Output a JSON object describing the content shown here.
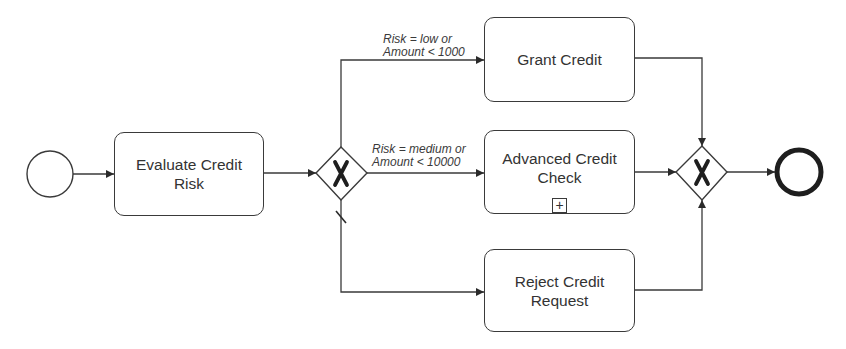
{
  "diagram": {
    "type": "BPMN process",
    "colors": {
      "stroke": "#3a3a3a",
      "text": "#333333",
      "background": "#ffffff"
    },
    "start_event": {
      "kind": "start-event"
    },
    "end_event": {
      "kind": "end-event"
    },
    "tasks": [
      {
        "id": "evaluate",
        "label": "Evaluate Credit Risk"
      },
      {
        "id": "grant",
        "label": "Grant Credit"
      },
      {
        "id": "advanced",
        "label": "Advanced Credit Check",
        "marker": "+"
      },
      {
        "id": "reject",
        "label": "Reject Credit Request"
      }
    ],
    "gateways": [
      {
        "id": "split",
        "kind": "exclusive-gateway",
        "marker": "X"
      },
      {
        "id": "merge",
        "kind": "exclusive-gateway",
        "marker": "X"
      }
    ],
    "flows": [
      {
        "from": "start",
        "to": "evaluate"
      },
      {
        "from": "evaluate",
        "to": "split"
      },
      {
        "from": "split",
        "to": "grant",
        "condition_line1": "Risk = low or",
        "condition_line2": "Amount < 1000"
      },
      {
        "from": "split",
        "to": "advanced",
        "condition_line1": "Risk = medium or",
        "condition_line2": "Amount < 10000"
      },
      {
        "from": "split",
        "to": "reject",
        "default": true
      },
      {
        "from": "grant",
        "to": "merge"
      },
      {
        "from": "advanced",
        "to": "merge"
      },
      {
        "from": "reject",
        "to": "merge"
      },
      {
        "from": "merge",
        "to": "end"
      }
    ]
  }
}
